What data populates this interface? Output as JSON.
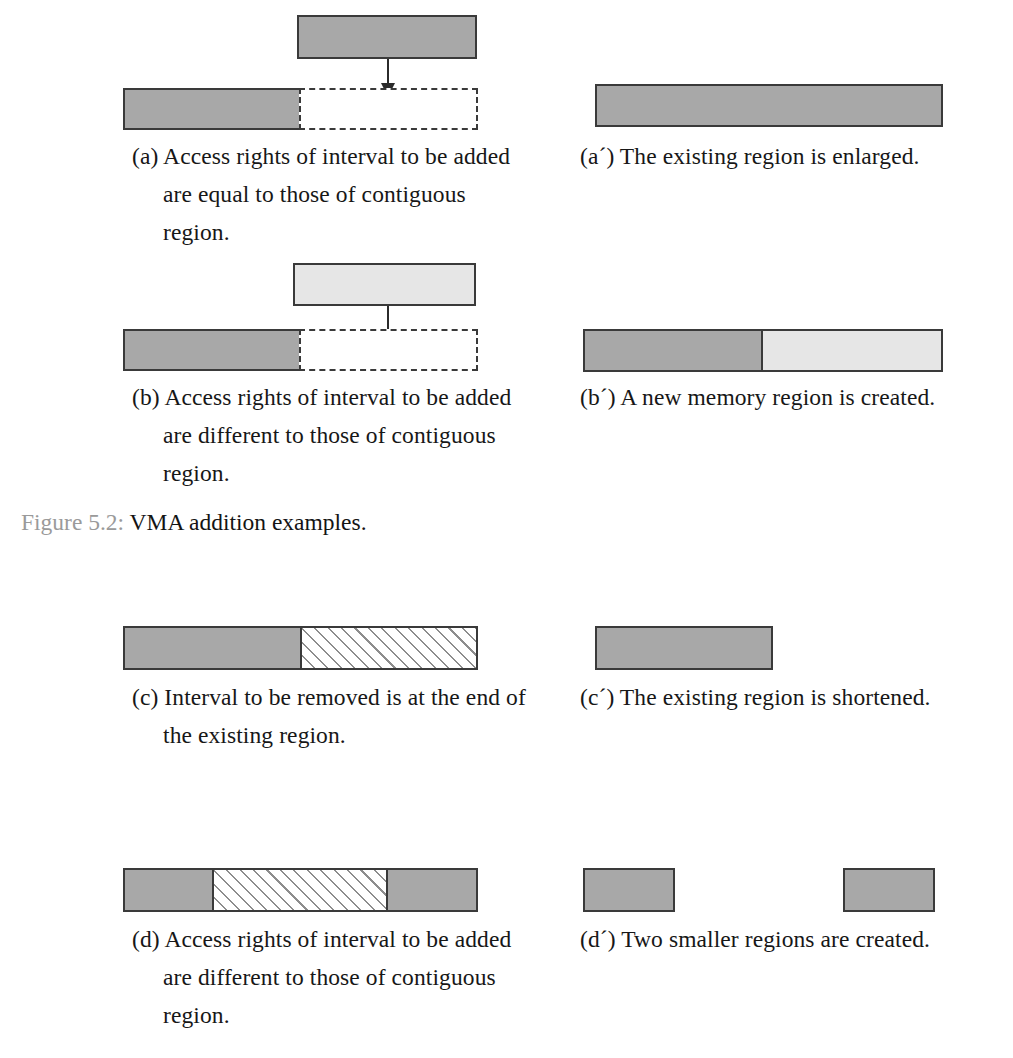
{
  "figure": {
    "label": "Figure 5.2:",
    "title": "VMA addition examples."
  },
  "colors": {
    "region_gray": "#a8a8a8",
    "region_light_gray": "#e6e6e6",
    "outline": "#3a3a3a",
    "hatch_line": "#8d8d8d",
    "caption_text": "#171717",
    "figure_label_gray": "#9a9a9a",
    "page_background": "#ffffff"
  },
  "panels": {
    "a": {
      "caption": "(a) Access rights of interval to be added are equal to those of contiguous region.",
      "diagram": {
        "added_interval_box": {
          "name": "interval-to-add",
          "fill": "gray"
        },
        "existing_region_box": {
          "name": "existing-region",
          "fill": "gray"
        },
        "target_slot_box": {
          "name": "target-slot",
          "fill": "white",
          "stroke": "dashed"
        },
        "arrow": "downward-arrow"
      }
    },
    "a_prime": {
      "caption": "(a´) The existing region is enlarged.",
      "diagram": {
        "result_box": {
          "name": "enlarged-region",
          "fill": "gray"
        }
      }
    },
    "b": {
      "caption": "(b) Access rights of interval to be added are different to those of contiguous region.",
      "diagram": {
        "added_interval_box": {
          "name": "interval-to-add",
          "fill": "light-gray"
        },
        "existing_region_box": {
          "name": "existing-region",
          "fill": "gray"
        },
        "target_slot_box": {
          "name": "target-slot",
          "fill": "white",
          "stroke": "dashed"
        },
        "arrow": "downward-arrow"
      }
    },
    "b_prime": {
      "caption": "(b´) A new memory region is created.",
      "diagram": {
        "segments": [
          {
            "name": "existing-region",
            "fill": "gray"
          },
          {
            "name": "new-region",
            "fill": "light-gray"
          }
        ]
      }
    },
    "c": {
      "caption": "(c) Interval to be removed is at the end of the existing region.",
      "diagram": {
        "segments": [
          {
            "name": "retained-region",
            "fill": "gray"
          },
          {
            "name": "interval-to-remove",
            "fill": "hatched"
          }
        ]
      }
    },
    "c_prime": {
      "caption": "(c´) The existing region is shortened.",
      "diagram": {
        "result_box": {
          "name": "shortened-region",
          "fill": "gray"
        }
      }
    },
    "d": {
      "caption": "(d) Access rights of interval to be added are different to those of contiguous region.",
      "diagram": {
        "segments": [
          {
            "name": "retained-region-left",
            "fill": "gray"
          },
          {
            "name": "interval-to-remove",
            "fill": "hatched"
          },
          {
            "name": "retained-region-right",
            "fill": "gray"
          }
        ]
      }
    },
    "d_prime": {
      "caption": "(d´) Two smaller regions are created.",
      "diagram": {
        "result_boxes": [
          {
            "name": "smaller-region-left",
            "fill": "gray"
          },
          {
            "name": "smaller-region-right",
            "fill": "gray"
          }
        ]
      }
    }
  }
}
